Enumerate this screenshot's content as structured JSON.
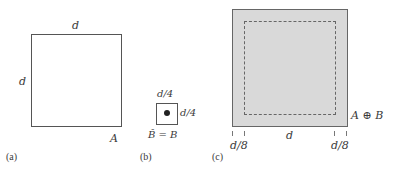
{
  "panel_a": {
    "caption": "(a)",
    "top_label": "d",
    "left_label": "d",
    "set_label": "A"
  },
  "panel_b": {
    "caption": "(b)",
    "top_label": "d/4",
    "right_label": "d/4",
    "set_label": "B̂ = B"
  },
  "panel_c": {
    "caption": "(c)",
    "set_label": "A ⊕ B",
    "bottom_left_label": "d/8",
    "bottom_center_label": "d",
    "bottom_right_label": "d/8",
    "fill_color": "#d9d9d9"
  }
}
